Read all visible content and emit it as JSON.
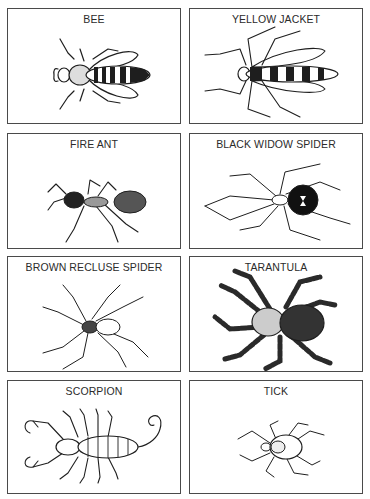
{
  "cards": [
    {
      "label": "BEE",
      "icon": "bee-illustration"
    },
    {
      "label": "YELLOW JACKET",
      "icon": "yellow-jacket-illustration"
    },
    {
      "label": "FIRE ANT",
      "icon": "fire-ant-illustration"
    },
    {
      "label": "BLACK WIDOW SPIDER",
      "icon": "black-widow-spider-illustration"
    },
    {
      "label": "BROWN RECLUSE SPIDER",
      "icon": "brown-recluse-spider-illustration"
    },
    {
      "label": "TARANTULA",
      "icon": "tarantula-illustration"
    },
    {
      "label": "SCORPION",
      "icon": "scorpion-illustration"
    },
    {
      "label": "TICK",
      "icon": "tick-illustration"
    }
  ],
  "colors": {
    "ink": "#1e1e1e",
    "border": "#4a4a4a",
    "background": "#ffffff"
  }
}
